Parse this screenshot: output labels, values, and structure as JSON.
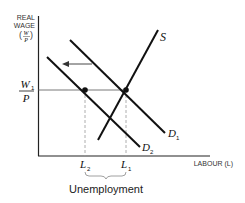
{
  "diagram": {
    "type": "labour-market-supply-demand",
    "y_axis": {
      "label_line1": "REAL",
      "label_line2": "WAGE",
      "label_fraction_num": "W",
      "label_fraction_den": "P"
    },
    "x_axis": {
      "label": "LABOUR (L)"
    },
    "wage_label": {
      "num_main": "W",
      "num_sub": "1",
      "den": "P"
    },
    "curves": [
      {
        "name": "S",
        "label": "S",
        "sub": ""
      },
      {
        "name": "D1",
        "label": "D",
        "sub": "1"
      },
      {
        "name": "D2",
        "label": "D",
        "sub": "2"
      }
    ],
    "x_ticks": [
      {
        "label": "L",
        "sub": "2"
      },
      {
        "label": "L",
        "sub": "1"
      }
    ],
    "shift_arrow": "leftward shift of demand from D1 to D2",
    "brace_caption": "Unemployment",
    "colors": {
      "curve": "#111111",
      "axis": "#222222",
      "guide": "#999999"
    }
  }
}
